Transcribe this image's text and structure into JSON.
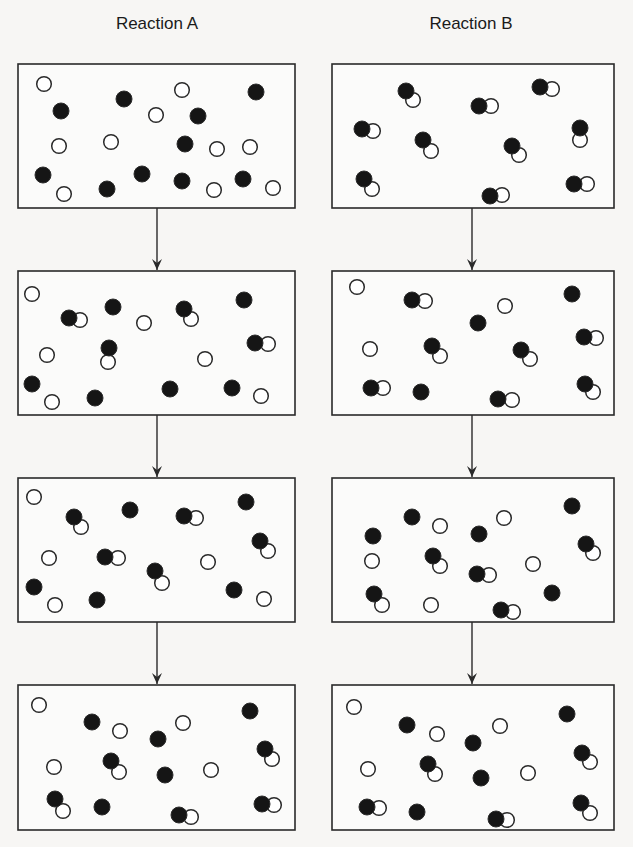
{
  "titles": {
    "reaction_a": "Reaction A",
    "reaction_b": "Reaction B"
  },
  "colors": {
    "background": "#f7f6f4",
    "box_fill": "#fbfbfa",
    "stroke": "#2a2a2a",
    "filled_atom": "#151515",
    "open_atom": "#ffffff"
  },
  "atom_radius": 8,
  "legend_note": "F = filled (black) atom, O = open (white) atom",
  "columns": [
    {
      "name": "Reaction A",
      "x": 18,
      "width": 277,
      "arrow_x": 157
    },
    {
      "name": "Reaction B",
      "x": 332,
      "width": 282,
      "arrow_x": 472
    }
  ],
  "rows": [
    {
      "y": 64,
      "height": 144
    },
    {
      "y": 271,
      "height": 144
    },
    {
      "y": 478,
      "height": 144
    },
    {
      "y": 685,
      "height": 145
    }
  ],
  "panels": [
    {
      "id": "A1",
      "reaction": "A",
      "step": 1,
      "atoms": [
        [
          "O",
          44,
          84
        ],
        [
          "F",
          124,
          99
        ],
        [
          "F",
          61,
          111
        ],
        [
          "O",
          182,
          90
        ],
        [
          "F",
          256,
          92
        ],
        [
          "O",
          156,
          115
        ],
        [
          "F",
          198,
          116
        ],
        [
          "O",
          59,
          146
        ],
        [
          "O",
          111,
          142
        ],
        [
          "F",
          185,
          144
        ],
        [
          "O",
          217,
          149
        ],
        [
          "O",
          250,
          147
        ],
        [
          "F",
          43,
          175
        ],
        [
          "F",
          142,
          174
        ],
        [
          "F",
          182,
          181
        ],
        [
          "F",
          243,
          179
        ],
        [
          "O",
          64,
          194
        ],
        [
          "F",
          107,
          189
        ],
        [
          "O",
          214,
          190
        ],
        [
          "O",
          273,
          188
        ]
      ]
    },
    {
      "id": "B1",
      "reaction": "B",
      "step": 1,
      "atoms": [
        [
          "O",
          413,
          100
        ],
        [
          "F",
          406,
          91
        ],
        [
          "O",
          491,
          106
        ],
        [
          "F",
          479,
          106
        ],
        [
          "O",
          552,
          89
        ],
        [
          "F",
          540,
          87
        ],
        [
          "O",
          373,
          131
        ],
        [
          "F",
          362,
          129
        ],
        [
          "O",
          580,
          140
        ],
        [
          "F",
          580,
          128
        ],
        [
          "O",
          431,
          151
        ],
        [
          "F",
          423,
          140
        ],
        [
          "O",
          519,
          155
        ],
        [
          "F",
          512,
          146
        ],
        [
          "O",
          372,
          189
        ],
        [
          "F",
          364,
          179
        ],
        [
          "O",
          502,
          195
        ],
        [
          "F",
          490,
          196
        ],
        [
          "O",
          587,
          184
        ],
        [
          "F",
          574,
          184
        ]
      ]
    },
    {
      "id": "A2",
      "reaction": "A",
      "step": 2,
      "atoms": [
        [
          "O",
          32,
          294
        ],
        [
          "O",
          80,
          320
        ],
        [
          "F",
          69,
          318
        ],
        [
          "F",
          113,
          307
        ],
        [
          "O",
          144,
          323
        ],
        [
          "O",
          191,
          319
        ],
        [
          "F",
          184,
          309
        ],
        [
          "F",
          244,
          300
        ],
        [
          "O",
          108,
          362
        ],
        [
          "F",
          109,
          348
        ],
        [
          "O",
          47,
          355
        ],
        [
          "O",
          268,
          344
        ],
        [
          "F",
          255,
          343
        ],
        [
          "O",
          205,
          359
        ],
        [
          "F",
          32,
          384
        ],
        [
          "O",
          52,
          402
        ],
        [
          "F",
          95,
          398
        ],
        [
          "F",
          170,
          389
        ],
        [
          "F",
          232,
          388
        ],
        [
          "O",
          261,
          396
        ]
      ]
    },
    {
      "id": "B2",
      "reaction": "B",
      "step": 2,
      "atoms": [
        [
          "O",
          357,
          287
        ],
        [
          "O",
          425,
          301
        ],
        [
          "F",
          412,
          300
        ],
        [
          "O",
          505,
          306
        ],
        [
          "F",
          572,
          294
        ],
        [
          "F",
          478,
          323
        ],
        [
          "O",
          596,
          338
        ],
        [
          "F",
          584,
          337
        ],
        [
          "O",
          370,
          349
        ],
        [
          "O",
          440,
          356
        ],
        [
          "F",
          432,
          346
        ],
        [
          "O",
          530,
          359
        ],
        [
          "F",
          521,
          350
        ],
        [
          "O",
          383,
          388
        ],
        [
          "F",
          371,
          388
        ],
        [
          "F",
          421,
          392
        ],
        [
          "O",
          512,
          400
        ],
        [
          "F",
          498,
          399
        ],
        [
          "O",
          593,
          392
        ],
        [
          "F",
          585,
          384
        ]
      ]
    },
    {
      "id": "A3",
      "reaction": "A",
      "step": 3,
      "atoms": [
        [
          "O",
          34,
          497
        ],
        [
          "O",
          81,
          527
        ],
        [
          "F",
          74,
          517
        ],
        [
          "F",
          130,
          510
        ],
        [
          "O",
          196,
          518
        ],
        [
          "F",
          184,
          516
        ],
        [
          "F",
          246,
          502
        ],
        [
          "O",
          268,
          551
        ],
        [
          "F",
          260,
          541
        ],
        [
          "O",
          49,
          558
        ],
        [
          "O",
          118,
          558
        ],
        [
          "F",
          105,
          557
        ],
        [
          "O",
          208,
          562
        ],
        [
          "O",
          162,
          583
        ],
        [
          "F",
          155,
          571
        ],
        [
          "F",
          34,
          587
        ],
        [
          "O",
          55,
          605
        ],
        [
          "F",
          97,
          600
        ],
        [
          "F",
          234,
          590
        ],
        [
          "O",
          264,
          599
        ]
      ]
    },
    {
      "id": "B3",
      "reaction": "B",
      "step": 3,
      "atoms": [
        [
          "F",
          572,
          506
        ],
        [
          "F",
          412,
          517
        ],
        [
          "O",
          440,
          526
        ],
        [
          "F",
          479,
          534
        ],
        [
          "O",
          504,
          518
        ],
        [
          "F",
          373,
          536
        ],
        [
          "O",
          593,
          553
        ],
        [
          "F",
          586,
          544
        ],
        [
          "O",
          372,
          561
        ],
        [
          "O",
          440,
          566
        ],
        [
          "F",
          433,
          556
        ],
        [
          "O",
          533,
          564
        ],
        [
          "O",
          489,
          575
        ],
        [
          "F",
          477,
          574
        ],
        [
          "F",
          552,
          593
        ],
        [
          "O",
          382,
          605
        ],
        [
          "F",
          374,
          594
        ],
        [
          "O",
          431,
          605
        ],
        [
          "O",
          513,
          612
        ],
        [
          "F",
          501,
          610
        ]
      ]
    },
    {
      "id": "A4",
      "reaction": "A",
      "step": 4,
      "atoms": [
        [
          "O",
          39,
          705
        ],
        [
          "F",
          92,
          722
        ],
        [
          "O",
          120,
          731
        ],
        [
          "O",
          183,
          723
        ],
        [
          "F",
          158,
          739
        ],
        [
          "F",
          250,
          711
        ],
        [
          "O",
          119,
          772
        ],
        [
          "F",
          111,
          761
        ],
        [
          "O",
          54,
          767
        ],
        [
          "F",
          165,
          775
        ],
        [
          "O",
          211,
          770
        ],
        [
          "O",
          272,
          759
        ],
        [
          "F",
          265,
          749
        ],
        [
          "O",
          63,
          811
        ],
        [
          "F",
          55,
          799
        ],
        [
          "F",
          102,
          807
        ],
        [
          "O",
          191,
          817
        ],
        [
          "F",
          179,
          815
        ],
        [
          "O",
          274,
          805
        ],
        [
          "F",
          262,
          804
        ]
      ]
    },
    {
      "id": "B4",
      "reaction": "B",
      "step": 4,
      "atoms": [
        [
          "O",
          354,
          707
        ],
        [
          "F",
          407,
          725
        ],
        [
          "O",
          437,
          734
        ],
        [
          "O",
          500,
          726
        ],
        [
          "F",
          473,
          743
        ],
        [
          "F",
          567,
          714
        ],
        [
          "O",
          590,
          762
        ],
        [
          "F",
          582,
          753
        ],
        [
          "O",
          435,
          774
        ],
        [
          "F",
          428,
          764
        ],
        [
          "O",
          368,
          769
        ],
        [
          "F",
          481,
          778
        ],
        [
          "O",
          528,
          773
        ],
        [
          "O",
          379,
          808
        ],
        [
          "F",
          367,
          807
        ],
        [
          "F",
          417,
          812
        ],
        [
          "O",
          507,
          820
        ],
        [
          "F",
          496,
          819
        ],
        [
          "O",
          590,
          813
        ],
        [
          "F",
          581,
          803
        ]
      ]
    }
  ]
}
